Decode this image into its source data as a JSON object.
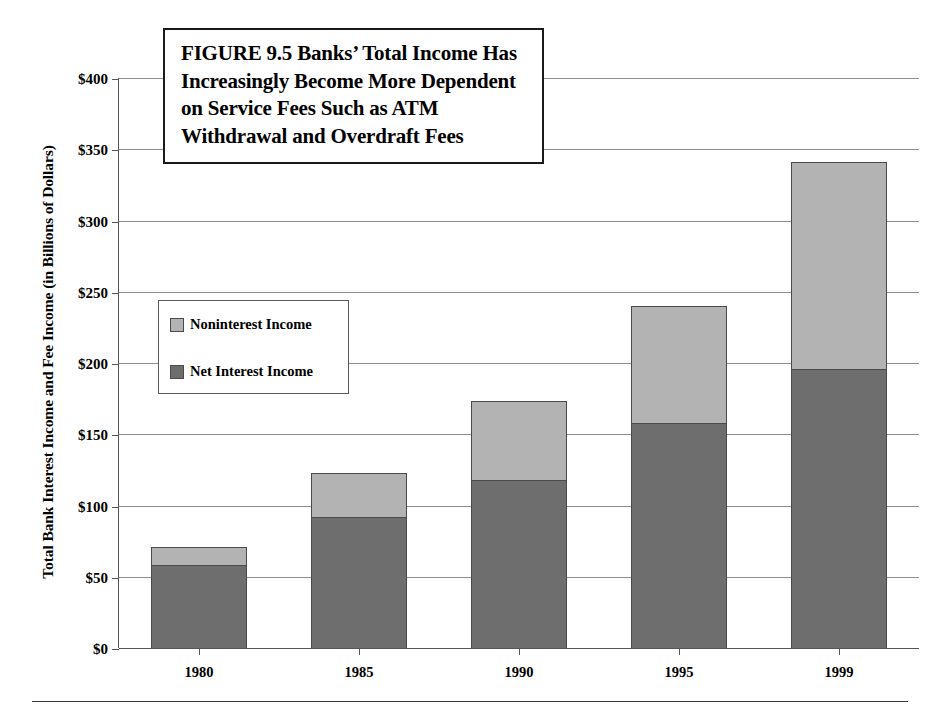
{
  "figure": {
    "title_lines": [
      "FIGURE 9.5  Banks’ Total Income Has",
      "Increasingly Become More Dependent",
      "on Service Fees Such as ATM",
      "Withdrawal and Overdraft Fees"
    ],
    "title_full": "FIGURE 9.5  Banks’ Total Income Has Increasingly Become More Dependent on Service Fees Such as ATM Withdrawal and Overdraft Fees"
  },
  "chart_data": {
    "type": "bar",
    "subtype": "stacked-vertical-bar",
    "title": "FIGURE 9.5  Banks’ Total Income Has Increasingly Become More Dependent on Service Fees Such as ATM Withdrawal and Overdraft Fees",
    "xlabel": "",
    "ylabel": "Total Bank Interest Income and Fee Income (in Billions of Dollars)",
    "categories": [
      "1980",
      "1985",
      "1990",
      "1995",
      "1999"
    ],
    "series": [
      {
        "name": "Net Interest Income",
        "color": "#6e6e6e",
        "values": [
          58,
          92,
          118,
          158,
          196
        ]
      },
      {
        "name": "Noninterest Income",
        "color": "#b3b3b3",
        "values": [
          13,
          31,
          55,
          82,
          145
        ]
      }
    ],
    "stack_order_bottom_to_top": [
      "Net Interest Income",
      "Noninterest Income"
    ],
    "totals": [
      71,
      123,
      173,
      240,
      341
    ],
    "ylim": [
      0,
      400
    ],
    "ytick_values": [
      0,
      50,
      100,
      150,
      200,
      250,
      300,
      350,
      400
    ],
    "ytick_labels": [
      "$0",
      "$50",
      "$100",
      "$150",
      "$200",
      "$250",
      "$300",
      "$350",
      "$400"
    ],
    "xtick_labels": [
      "1980",
      "1985",
      "1990",
      "1995",
      "1999"
    ],
    "grid": true,
    "grid_axis": "y",
    "legend": [
      "Noninterest Income",
      "Net Interest Income"
    ],
    "legend_position": "inside-upper-left",
    "units": "Billions of Dollars"
  },
  "legend": {
    "items": [
      {
        "label": "Noninterest Income",
        "color": "#b3b3b3"
      },
      {
        "label": "Net Interest Income",
        "color": "#6e6e6e"
      }
    ]
  },
  "axes": {
    "y_title": "Total Bank Interest Income and Fee Income (in Billions of Dollars)"
  },
  "colors": {
    "noninterest": "#b3b3b3",
    "net_interest": "#6e6e6e",
    "bar_stroke": "#4a4a4a",
    "gridline": "#8d8d8d",
    "axis": "#555555",
    "title_border": "#1a1a1a",
    "background": "#ffffff"
  }
}
